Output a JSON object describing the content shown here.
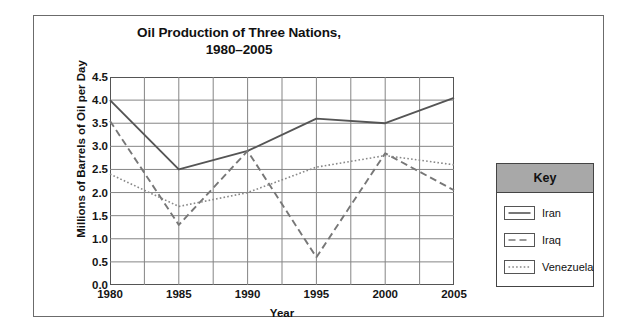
{
  "chart_data": {
    "type": "line",
    "title": "Oil Production of Three Nations, 1980–2005",
    "title_line1": "Oil Production of Three Nations,",
    "title_line2": "1980–2005",
    "xlabel": "Year",
    "ylabel": "Millions of Barrels of Oil per Day",
    "categories": [
      1980,
      1985,
      1990,
      1995,
      2000,
      2005
    ],
    "xticklabels": [
      "1980",
      "1985",
      "1990",
      "1995",
      "2000",
      "2005"
    ],
    "yticklabels": [
      "4.5",
      "4.0",
      "3.5",
      "3.0",
      "2.5",
      "2.0",
      "1.5",
      "1.0",
      "0.5",
      "0.0"
    ],
    "ytickvalues": [
      4.5,
      4.0,
      3.5,
      3.0,
      2.5,
      2.0,
      1.5,
      1.0,
      0.5,
      0.0
    ],
    "ylim": [
      0.0,
      4.5
    ],
    "xlim": [
      1980,
      2005
    ],
    "grid": true,
    "minor_x_gridlines": true,
    "legend_position": "right-outside",
    "series": [
      {
        "name": "Iran",
        "style": "solid",
        "color": "#555555",
        "values": [
          4.0,
          2.5,
          2.9,
          3.6,
          3.5,
          4.05
        ]
      },
      {
        "name": "Iraq",
        "style": "dashed",
        "color": "#777777",
        "values": [
          3.55,
          1.3,
          2.9,
          0.6,
          2.85,
          2.05
        ]
      },
      {
        "name": "Venezuela",
        "style": "dotted",
        "color": "#888888",
        "values": [
          2.4,
          1.7,
          2.0,
          2.55,
          2.8,
          2.6
        ]
      }
    ]
  },
  "legend": {
    "header_label": "Key",
    "header_bg": "#a8a8a8",
    "items": [
      {
        "label": "Iran",
        "style": "solid"
      },
      {
        "label": "Iraq",
        "style": "dashed"
      },
      {
        "label": "Venezuela",
        "style": "dotted"
      }
    ]
  }
}
